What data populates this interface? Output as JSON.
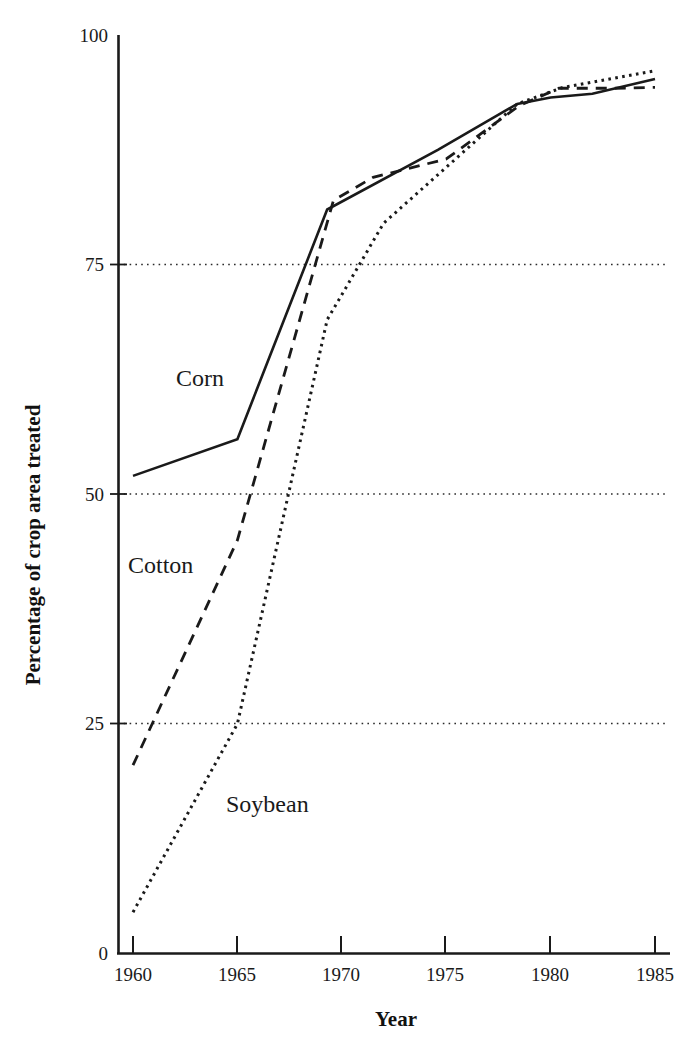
{
  "chart_data": {
    "type": "line",
    "title": "",
    "subtitle": "",
    "xlabel": "Year",
    "ylabel": "Percentage of crop area treated",
    "xlim": [
      1960,
      1985
    ],
    "ylim": [
      0,
      100
    ],
    "x_ticks": [
      1960,
      1965,
      1970,
      1975,
      1980,
      1985
    ],
    "x_tick_labels": [
      "1960",
      "1965",
      "1970",
      "1975",
      "1980",
      "1985"
    ],
    "y_ticks": [
      0,
      25,
      50,
      75,
      100
    ],
    "y_tick_labels": [
      "0",
      "25",
      "50",
      "75",
      "100"
    ],
    "grid": "horizontal-dotted at 25, 50, 75",
    "legend": "inline annotations next to each curve",
    "series": [
      {
        "name": "Corn",
        "line_style": "solid",
        "label_position": {
          "x": 1962.0,
          "y": 63.5
        },
        "x": [
          1960,
          1965,
          1969.3,
          1974.6,
          1978.4,
          1980.0,
          1982.0,
          1985
        ],
        "values": [
          52,
          56,
          81,
          87.5,
          92.5,
          93.2,
          93.6,
          95.2
        ]
      },
      {
        "name": "Cotton",
        "line_style": "dashed",
        "label_position": {
          "x": 1960.2,
          "y": 45.0
        },
        "x": [
          1960,
          1965,
          1969.6,
          1971.5,
          1975.0,
          1978.5,
          1980.4,
          1983.0,
          1985
        ],
        "values": [
          20.5,
          45,
          82,
          84.5,
          86.5,
          92.3,
          94.2,
          94.2,
          94.3
        ]
      },
      {
        "name": "Soybean",
        "line_style": "dotted",
        "label_position": {
          "x": 1965.0,
          "y": 17.0
        },
        "x": [
          1960,
          1965,
          1969.3,
          1972.0,
          1978.4,
          1980.6,
          1985
        ],
        "values": [
          4.5,
          25,
          69,
          79.5,
          92.5,
          94.3,
          96.1
        ]
      }
    ]
  },
  "axes": {
    "x_axis_title": "Year",
    "y_axis_title": "Percentage of crop area treated"
  },
  "labels": {
    "corn": "Corn",
    "cotton": "Cotton",
    "soybean": "Soybean"
  },
  "y_tick_labels": {
    "t0": "0",
    "t25": "25",
    "t50": "50",
    "t75": "75",
    "t100": "100"
  },
  "x_tick_labels": {
    "t1960": "1960",
    "t1965": "1965",
    "t1970": "1970",
    "t1975": "1975",
    "t1980": "1980",
    "t1985": "1985"
  },
  "colors": {
    "ink": "#1a1a1a",
    "background": "#ffffff"
  }
}
